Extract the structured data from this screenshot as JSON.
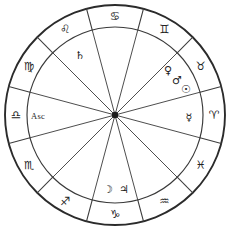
{
  "chart": {
    "type": "zodiac-wheel",
    "geometry": {
      "center_x": 115,
      "center_y": 115,
      "outer_radius": 110,
      "inner_radius": 88,
      "hub_radius": 3.2,
      "sector_count": 12
    },
    "colors": {
      "background": "#ffffff",
      "rim_stroke": "#2b2b2b",
      "line_stroke": "#3d3d3d",
      "glyph_fill": "#232323",
      "hub_fill": "#1c1c1c"
    },
    "signs": [
      {
        "name": "libra",
        "glyph": "♎",
        "label": "Libra",
        "angle": 180,
        "sector_index": 0
      },
      {
        "name": "virgo",
        "glyph": "♍",
        "label": "Virgo",
        "angle": 210,
        "sector_index": 1
      },
      {
        "name": "leo",
        "glyph": "♌",
        "label": "Leo",
        "angle": 240,
        "sector_index": 2
      },
      {
        "name": "cancer",
        "glyph": "♋",
        "label": "Cancer",
        "angle": 270,
        "sector_index": 3
      },
      {
        "name": "gemini",
        "glyph": "♊",
        "label": "Gemini",
        "angle": 300,
        "sector_index": 4
      },
      {
        "name": "taurus",
        "glyph": "♉",
        "label": "Taurus",
        "angle": 330,
        "sector_index": 5
      },
      {
        "name": "aries",
        "glyph": "♈",
        "label": "Aries",
        "angle": 0,
        "sector_index": 6
      },
      {
        "name": "pisces",
        "glyph": "♓",
        "label": "Pisces",
        "angle": 30,
        "sector_index": 7
      },
      {
        "name": "aquarius",
        "glyph": "♒",
        "label": "Aquarius",
        "angle": 60,
        "sector_index": 8
      },
      {
        "name": "capricorn",
        "glyph": "♑",
        "label": "Capricorn",
        "angle": 90,
        "sector_index": 9
      },
      {
        "name": "sagittarius",
        "glyph": "♐",
        "label": "Sagittarius",
        "angle": 120,
        "sector_index": 10
      },
      {
        "name": "scorpio",
        "glyph": "♏",
        "label": "Scorpio",
        "angle": 150,
        "sector_index": 11
      }
    ],
    "planets": [
      {
        "name": "saturn",
        "glyph": "♄",
        "label": "Saturn",
        "x": 80,
        "y": 55
      },
      {
        "name": "venus",
        "glyph": "♀",
        "label": "Venus",
        "x": 168,
        "y": 70
      },
      {
        "name": "mars",
        "glyph": "♂",
        "label": "Mars",
        "x": 177,
        "y": 80
      },
      {
        "name": "sun",
        "glyph": "☉",
        "label": "Sun",
        "x": 186,
        "y": 89
      },
      {
        "name": "mercury",
        "glyph": "☿",
        "label": "Mercury",
        "x": 189,
        "y": 117
      },
      {
        "name": "moon",
        "glyph": "☽",
        "label": "Moon",
        "x": 108,
        "y": 189
      },
      {
        "name": "jupiter",
        "glyph": "♃",
        "label": "Jupiter",
        "x": 124,
        "y": 189
      }
    ],
    "points": [
      {
        "name": "ascendant",
        "label": "Asc",
        "x": 38,
        "y": 116
      }
    ]
  }
}
